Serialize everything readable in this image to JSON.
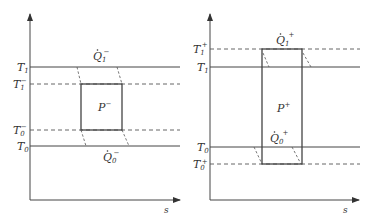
{
  "diagram": {
    "type": "temperature-entropy comparison",
    "colors": {
      "line": "#444444",
      "dashed": "#555555",
      "background": "#ffffff"
    },
    "left": {
      "x_axis_label": "s",
      "levels": [
        {
          "id": "T1",
          "label": "T",
          "sub": "1",
          "sup": "",
          "style": "solid"
        },
        {
          "id": "T1-",
          "label": "T",
          "sub": "1",
          "sup": "−",
          "style": "dashed"
        },
        {
          "id": "T0-",
          "label": "T",
          "sub": "0",
          "sup": "−",
          "style": "dashed"
        },
        {
          "id": "T0",
          "label": "T",
          "sub": "0",
          "sup": "",
          "style": "solid"
        }
      ],
      "heat_in": {
        "label": "Q",
        "sub": "1",
        "sup": "−"
      },
      "heat_out": {
        "label": "Q",
        "sub": "0",
        "sup": "−"
      },
      "power": {
        "label": "P",
        "sup": "−"
      }
    },
    "right": {
      "x_axis_label": "s",
      "levels": [
        {
          "id": "T1+",
          "label": "T",
          "sub": "1",
          "sup": "+",
          "style": "dashed"
        },
        {
          "id": "T1",
          "label": "T",
          "sub": "1",
          "sup": "",
          "style": "solid"
        },
        {
          "id": "T0",
          "label": "T",
          "sub": "0",
          "sup": "",
          "style": "solid"
        },
        {
          "id": "T0+",
          "label": "T",
          "sub": "0",
          "sup": "+",
          "style": "dashed"
        }
      ],
      "heat_in": {
        "label": "Q",
        "sub": "1",
        "sup": "+"
      },
      "heat_out": {
        "label": "Q",
        "sub": "0",
        "sup": "+"
      },
      "power": {
        "label": "P",
        "sup": "+"
      }
    }
  }
}
